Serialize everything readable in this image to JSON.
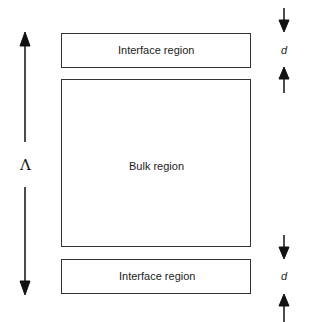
{
  "diagram": {
    "regions": [
      {
        "id": "top-interface",
        "label": "Interface region"
      },
      {
        "id": "bulk",
        "label": "Bulk region"
      },
      {
        "id": "bottom-interface",
        "label": "Interface region"
      }
    ],
    "period_symbol": "Λ",
    "thickness_symbol_top": "d",
    "thickness_symbol_bottom": "d",
    "colors": {
      "line": "#333333",
      "arrow": "#111111",
      "background": "#ffffff"
    }
  }
}
